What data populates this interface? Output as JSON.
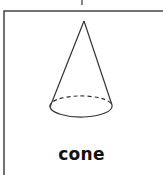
{
  "diagram": {
    "shape_name": "cone",
    "label": "cone",
    "stroke_color": "#333333",
    "background": "#ffffff"
  }
}
